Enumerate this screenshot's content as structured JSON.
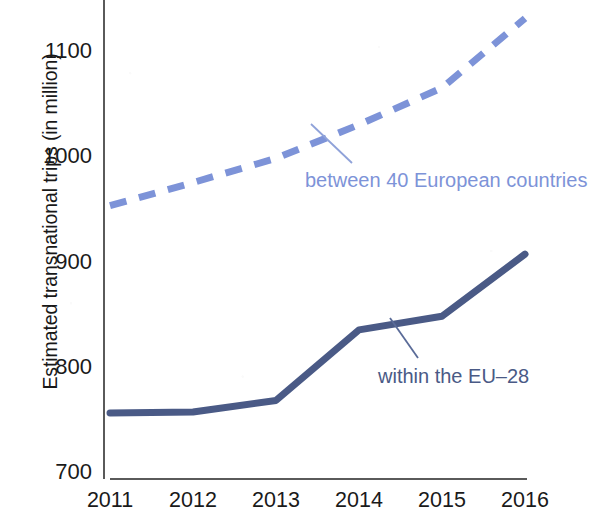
{
  "chart_data": {
    "type": "line",
    "title": "",
    "subtitle": "",
    "xlabel": "",
    "ylabel": "Estimated transnational trips (in million)",
    "x": [
      2011,
      2012,
      2013,
      2014,
      2015,
      2016
    ],
    "categories": [
      "2011",
      "2012",
      "2013",
      "2014",
      "2015",
      "2016"
    ],
    "xtick_labels": [
      "2011",
      "2012",
      "2013",
      "2014",
      "2015",
      "2016"
    ],
    "ytick_labels": [
      "700",
      "800",
      "900",
      "1000",
      "1100"
    ],
    "ytick_values": [
      700,
      800,
      900,
      1000,
      1100
    ],
    "ylim": [
      700,
      1145
    ],
    "xlim": [
      2011,
      2016
    ],
    "grid": false,
    "legend_position": "inline-annotations",
    "series": [
      {
        "name": "between 40 European countries",
        "style": "dashed",
        "color": "#7d93d8",
        "label_color": "#7d93d8",
        "values": [
          953,
          975,
          998,
          1030,
          1065,
          1131
        ]
      },
      {
        "name": "within the EU-28",
        "style": "solid",
        "color": "#4a5a86",
        "label_color": "#4a5a86",
        "values": [
          756,
          757,
          768,
          835,
          848,
          907
        ]
      }
    ],
    "annotations": [
      {
        "text": "between 40 European countries",
        "series": "between 40 European countries",
        "color": "#7d93d8"
      },
      {
        "text": "within the EU–28",
        "series": "within the EU-28",
        "color": "#4a5a86"
      }
    ],
    "axis_color": "#5a5a5a",
    "background_color": "#ffffff"
  },
  "axis": {
    "y_title": "Estimated transnational trips (in million)"
  },
  "labels": {
    "dashed_series": "between 40 European countries",
    "solid_series": "within the EU–28"
  },
  "yticks": [
    {
      "label": "1100",
      "value": 1100
    },
    {
      "label": "1000",
      "value": 1000
    },
    {
      "label": "900",
      "value": 900
    },
    {
      "label": "800",
      "value": 800
    },
    {
      "label": "700",
      "value": 700
    }
  ],
  "xticks": [
    {
      "label": "2011",
      "value": 2011
    },
    {
      "label": "2012",
      "value": 2012
    },
    {
      "label": "2013",
      "value": 2013
    },
    {
      "label": "2014",
      "value": 2014
    },
    {
      "label": "2015",
      "value": 2015
    },
    {
      "label": "2016",
      "value": 2016
    }
  ]
}
